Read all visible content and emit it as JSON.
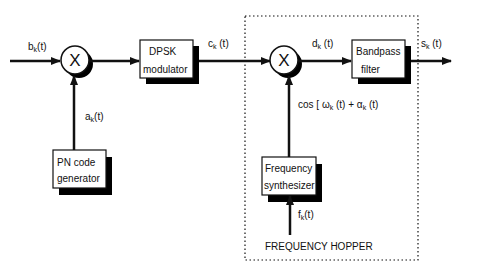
{
  "diagram": {
    "blocks": {
      "mixer1": {
        "symbol": "X"
      },
      "dpsk": {
        "line1": "DPSK",
        "line2": "modulator"
      },
      "mixer2": {
        "symbol": "X"
      },
      "bandpass": {
        "line1": "Bandpass",
        "line2": "filter"
      },
      "pn": {
        "line1": "PN code",
        "line2": "generator"
      },
      "synth": {
        "line1": "Frequency",
        "line2": "synthesizer"
      }
    },
    "signals": {
      "input": {
        "base": "b",
        "sub": "k",
        "tail": "(t)"
      },
      "pn_out": {
        "base": "a",
        "sub": "k",
        "tail": "(t)"
      },
      "dpsk_out": {
        "base": "c",
        "sub": "k",
        "tail": " (t)"
      },
      "mixer_out": {
        "base": "d",
        "sub": "k",
        "tail": " (t)"
      },
      "output": {
        "base": "s",
        "sub": "k",
        "tail": " (t)"
      },
      "carrier": {
        "pre": "cos [ ω",
        "sub1": "k",
        "mid": " (t) + α",
        "sub2": "k",
        "tail": " (t)"
      },
      "hop_freq": {
        "base": "f",
        "sub": "k",
        "tail": "(t)"
      }
    },
    "group_label": "FREQUENCY HOPPER",
    "colors": {
      "line": "#111111",
      "shadow": "#000000",
      "background": "#ffffff"
    }
  }
}
